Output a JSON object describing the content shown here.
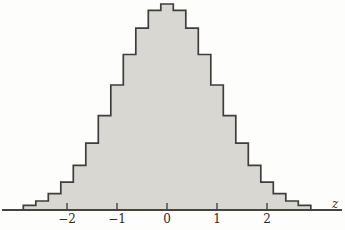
{
  "figure": {
    "background_color": "#fdfdfc"
  },
  "chart_data": {
    "type": "bar",
    "title": "",
    "xlabel": "z",
    "ylabel": "",
    "grid": false,
    "legend": null,
    "xlim": [
      -3.3,
      3.6
    ],
    "ylim": [
      0,
      0.42
    ],
    "x_ticks": [
      -2,
      -1,
      0,
      1,
      2
    ],
    "x_tick_labels": [
      "−2",
      "−1",
      "0",
      "1",
      "2"
    ],
    "bin_width": 0.25,
    "bin_centers": [
      -2.75,
      -2.5,
      -2.25,
      -2.0,
      -1.75,
      -1.5,
      -1.25,
      -1.0,
      -0.75,
      -0.5,
      -0.25,
      0,
      0.25,
      0.5,
      0.75,
      1.0,
      1.25,
      1.5,
      1.75,
      2.0,
      2.25,
      2.5,
      2.75
    ],
    "densities": [
      0.0091,
      0.0175,
      0.0317,
      0.054,
      0.0863,
      0.1295,
      0.1826,
      0.242,
      0.3011,
      0.3521,
      0.3867,
      0.3989,
      0.3867,
      0.3521,
      0.3011,
      0.242,
      0.1826,
      0.1295,
      0.0863,
      0.054,
      0.0317,
      0.0175,
      0.0091
    ],
    "colors": {
      "bar_fill": "#d8d7d2",
      "outline": "#3f3e3b",
      "axis_line": "#45433f",
      "text": "#2e2c29"
    }
  }
}
